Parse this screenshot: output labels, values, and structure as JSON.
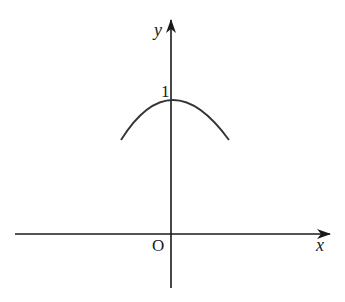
{
  "figure": {
    "type": "coordinate-graph",
    "x_axis": {
      "label": "x"
    },
    "y_axis": {
      "label": "y"
    },
    "origin_label": "O",
    "y_tick_label": "1",
    "curve": {
      "shape": "downward-opening arc",
      "vertex": [
        0,
        1
      ],
      "color": "#333333"
    },
    "axis_color": "#1a1a1a"
  }
}
